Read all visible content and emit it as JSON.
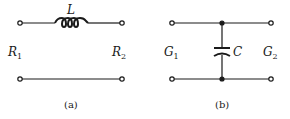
{
  "figure_a": {
    "caption": "(a)",
    "component_label": "L",
    "left_label": "R",
    "left_sub": "1",
    "right_label": "R",
    "right_sub": "2"
  },
  "figure_b": {
    "caption": "(b)",
    "component_label": "C",
    "left_label": "G",
    "left_sub": "1",
    "right_label": "G",
    "right_sub": "2"
  },
  "colors": {
    "ink": "#1a1a1a",
    "background": "#ffffff"
  }
}
